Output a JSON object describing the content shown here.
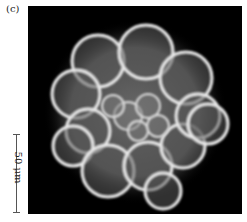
{
  "figure": {
    "panel_label": "(c)",
    "scale_bar_label": "50 μm",
    "image_description": "fluorescence micrograph of spherical cell cluster"
  }
}
